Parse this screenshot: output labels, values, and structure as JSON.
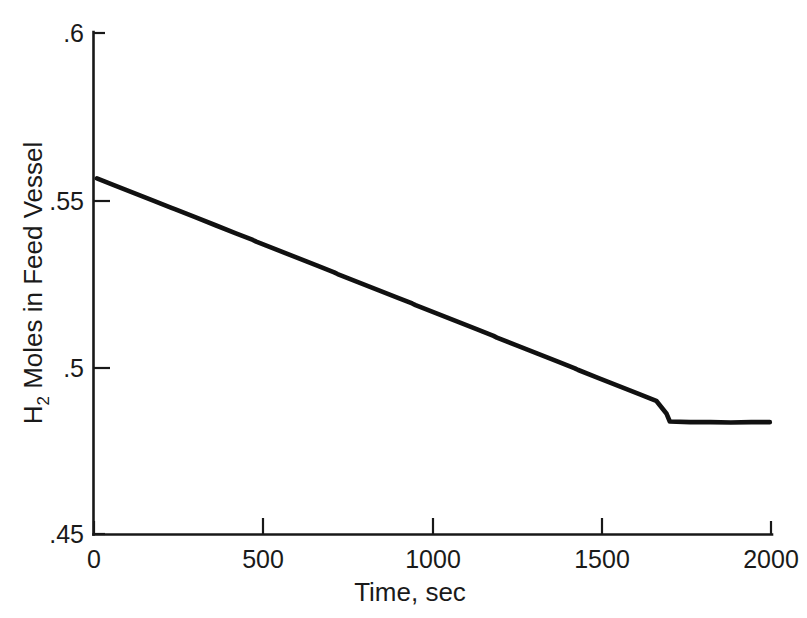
{
  "chart_data": {
    "type": "line",
    "title": "",
    "xlabel": "Time, sec",
    "ylabel": "H2 Moles in Feed Vessel",
    "ylabel_base": "H",
    "ylabel_sub": "2",
    "ylabel_rest": " Moles in Feed Vessel",
    "xlim": [
      0,
      2000
    ],
    "ylim": [
      0.45,
      0.6
    ],
    "xticks": [
      0,
      500,
      1000,
      1500,
      2000
    ],
    "xtick_labels": [
      "0",
      "500",
      "1000",
      "1500",
      "2000"
    ],
    "yticks": [
      0.45,
      0.5,
      0.55,
      0.6
    ],
    "ytick_labels": [
      ".45",
      ".5",
      ".55",
      ".6"
    ],
    "grid": false,
    "legend": null,
    "line_color": "#111111",
    "series": [
      {
        "name": "H2 moles in feed vessel",
        "x": [
          10,
          60,
          120,
          180,
          230,
          240,
          300,
          360,
          420,
          470,
          480,
          540,
          600,
          660,
          710,
          720,
          780,
          840,
          900,
          940,
          950,
          1010,
          1070,
          1130,
          1180,
          1190,
          1250,
          1310,
          1370,
          1420,
          1430,
          1490,
          1550,
          1610,
          1660,
          1690,
          1700,
          1760,
          1820,
          1880,
          1940,
          1995
        ],
        "y": [
          0.5565,
          0.5545,
          0.5521,
          0.5497,
          0.5477,
          0.5473,
          0.5449,
          0.5425,
          0.5401,
          0.5381,
          0.5376,
          0.5352,
          0.5328,
          0.5304,
          0.5284,
          0.5279,
          0.5255,
          0.5231,
          0.5207,
          0.5191,
          0.5186,
          0.5162,
          0.5138,
          0.5114,
          0.5094,
          0.5089,
          0.5065,
          0.5041,
          0.5017,
          0.4997,
          0.4992,
          0.4968,
          0.4944,
          0.492,
          0.49,
          0.4862,
          0.4838,
          0.4836,
          0.4836,
          0.4835,
          0.4836,
          0.4836
        ]
      }
    ],
    "annotations": []
  },
  "figure": {
    "background_color": "#ffffff",
    "foreground_color": "#111111"
  }
}
